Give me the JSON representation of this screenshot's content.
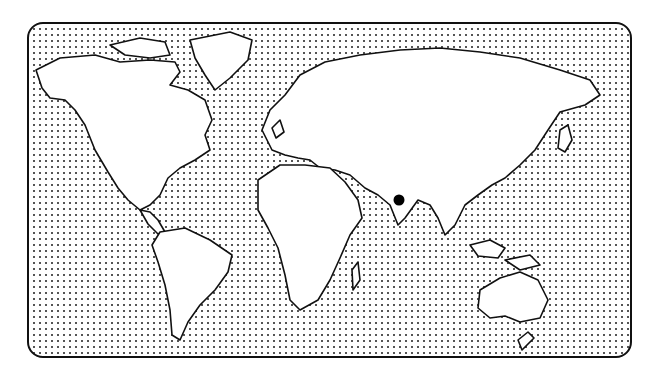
{
  "map": {
    "type": "world-outline-map",
    "background_pattern": "dot-grid",
    "frame_color": "#111111",
    "land_fill": "#ffffff",
    "marker": {
      "label": "",
      "region": "India (central)",
      "x": 399,
      "y": 200,
      "color": "#000000"
    }
  }
}
